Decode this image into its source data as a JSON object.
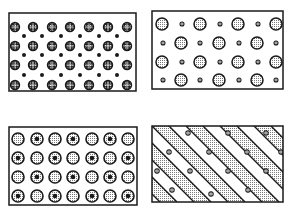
{
  "figure": {
    "colors": {
      "ink": "#1a1a1a",
      "paper": "#ffffff",
      "stipple": "#8a8a8a"
    }
  },
  "panels": [
    {
      "id": "top-left",
      "box": [
        9,
        13,
        127,
        78
      ],
      "kind": "hatched-large-with-small-dots",
      "large_rows_y": [
        27,
        46,
        65,
        85
      ],
      "large_cols_x": [
        15,
        33,
        52,
        70,
        89,
        108,
        127
      ],
      "large_r": 4.5,
      "small_rows_y": [
        36,
        55,
        75
      ],
      "small_cols_x": [
        24,
        42,
        61,
        80,
        99,
        117
      ],
      "small_r": 2
    },
    {
      "id": "top-right",
      "box": [
        152,
        11,
        131,
        78
      ],
      "kind": "stippled-large-with-small",
      "rows": [
        {
          "y": 24,
          "large_x": [
            162,
            200,
            238,
            276
          ],
          "small_x": [
            182,
            220,
            258
          ]
        },
        {
          "y": 43,
          "large_x": [
            181,
            219,
            257
          ],
          "small_x": [
            163,
            200,
            239,
            276
          ]
        },
        {
          "y": 62,
          "large_x": [
            162,
            200,
            238,
            276
          ],
          "small_x": [
            182,
            220,
            258
          ]
        },
        {
          "y": 80,
          "large_x": [
            181,
            219,
            257
          ],
          "small_x": [
            163,
            200,
            239,
            276
          ]
        }
      ],
      "large_r": 6,
      "small_r": 2
    },
    {
      "id": "bottom-left",
      "box": [
        9,
        127,
        128,
        78
      ],
      "kind": "stippled-cored-grid",
      "rows_y": [
        139,
        158,
        177,
        196
      ],
      "cols_x": [
        18,
        37,
        55,
        73,
        92,
        110,
        128
      ],
      "r": 6,
      "cores": [
        [
          0,
          1,
          0,
          1,
          0,
          1,
          0
        ],
        [
          1,
          0,
          1,
          0,
          1,
          0,
          1
        ],
        [
          0,
          1,
          0,
          1,
          0,
          1,
          0
        ],
        [
          1,
          0,
          1,
          0,
          1,
          0,
          1
        ]
      ]
    },
    {
      "id": "bottom-right",
      "box": [
        152,
        126,
        131,
        76
      ],
      "kind": "diagonal-bands",
      "band_width": 17,
      "particles": [
        [
          188,
          133
        ],
        [
          228,
          133
        ],
        [
          266,
          133
        ],
        [
          169,
          152
        ],
        [
          209,
          152
        ],
        [
          247,
          152
        ],
        [
          281,
          152
        ],
        [
          157,
          171
        ],
        [
          190,
          171
        ],
        [
          228,
          171
        ],
        [
          266,
          171
        ],
        [
          172,
          190
        ],
        [
          211,
          194
        ],
        [
          248,
          190
        ]
      ]
    }
  ]
}
